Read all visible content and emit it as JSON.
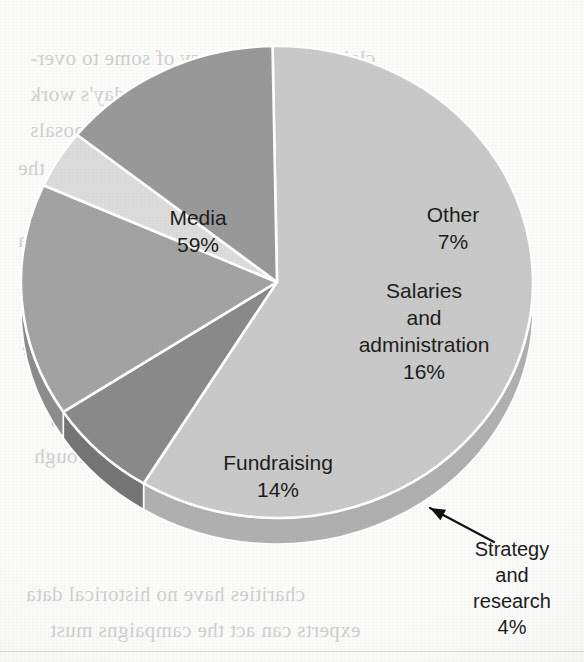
{
  "chart_data": {
    "type": "pie",
    "title": "",
    "categories": [
      "Media",
      "Other",
      "Salaries and administration",
      "Strategy and research",
      "Fundraising"
    ],
    "values": [
      59,
      7,
      16,
      4,
      14
    ],
    "value_suffix": "%",
    "legend": "none",
    "style": "3d-pie-grayscale",
    "slices": [
      {
        "id": "media",
        "label": "Media",
        "value": 59,
        "value_text": "59%",
        "color": "#c9c9c9",
        "side_color": "#b0b0b0",
        "label_line1": "Media",
        "label_line2": "59%",
        "label_x": 198,
        "label_y": 225,
        "callout": false
      },
      {
        "id": "other",
        "label": "Other",
        "value": 7,
        "value_text": "7%",
        "color": "#8a8a8a",
        "side_color": "#757575",
        "label_line1": "Other",
        "label_line2": "7%",
        "label_x": 453,
        "label_y": 222,
        "callout": false
      },
      {
        "id": "salaries-and-administration",
        "label": "Salaries and administration",
        "value": 16,
        "value_text": "16%",
        "color": "#a3a3a3",
        "side_color": "#8d8d8d",
        "label_line1": "Salaries",
        "label_line2": "and",
        "label_line3": "administration",
        "label_line4": "16%",
        "label_x": 424,
        "label_y": 298,
        "callout": false
      },
      {
        "id": "strategy-and-research",
        "label": "Strategy and research",
        "value": 4,
        "value_text": "4%",
        "color": "#dcdcdc",
        "side_color": "#c2c2c2",
        "label_line1": "Strategy",
        "label_line2": "and",
        "label_line3": "research",
        "label_line4": "4%",
        "label_x": 512,
        "label_y": 556,
        "callout": true
      },
      {
        "id": "fundraising",
        "label": "Fundraising",
        "value": 14,
        "value_text": "14%",
        "color": "#999999",
        "side_color": "#848484",
        "label_line1": "Fundraising",
        "label_line2": "14%",
        "label_x": 278,
        "label_y": 470,
        "callout": false
      }
    ],
    "separator_color": "#ffffff",
    "background_color": "#fbfbfa",
    "total": 100
  },
  "bleed_text": {
    "note": "faint mirrored text showing through from the reverse side of the scanned page",
    "lines": [
      {
        "text": "claim, as the tendency of some to over-",
        "x": 30,
        "y": 46
      },
      {
        "text": "spend, are still current on today's work",
        "x": 30,
        "y": 82
      },
      {
        "text": "past that the and policy proposals",
        "x": 30,
        "y": 118
      },
      {
        "text": "the campaigns, very directly from the",
        "x": 18,
        "y": 156
      },
      {
        "text": "their strengths. Of course, to",
        "x": 60,
        "y": 192
      },
      {
        "text": "Whatever the Truthas Clinton, America",
        "x": 18,
        "y": 228
      },
      {
        "text": "The issue is affected the answer",
        "x": 44,
        "y": 264
      },
      {
        "text": "reading its news and bad words may",
        "x": 34,
        "y": 300
      },
      {
        "text": "because it is visible in its reach and see",
        "x": 22,
        "y": 336
      },
      {
        "text": "to observers who have increased",
        "x": 58,
        "y": 372
      },
      {
        "text": "political money of some charity to",
        "x": 50,
        "y": 408
      },
      {
        "text": "value of information services through",
        "x": 34,
        "y": 444
      },
      {
        "text": "charities have no historical data",
        "x": 26,
        "y": 582
      },
      {
        "text": "experts can act the campaigns must",
        "x": 50,
        "y": 618
      }
    ]
  },
  "geometry": {
    "center_x": 277,
    "center_y": 282,
    "radius_x": 256,
    "radius_y": 236,
    "depth": 26,
    "start_angle_deg": -91
  },
  "callout": {
    "arrow_from_x": 494,
    "arrow_from_y": 542,
    "arrow_to_x": 430,
    "arrow_to_y": 508,
    "color": "#111111"
  }
}
